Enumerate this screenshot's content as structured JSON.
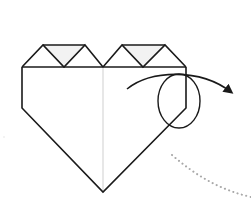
{
  "diagram": {
    "step_instruction": "fold corner behind (mountain fold) at circled area",
    "colors": {
      "stroke": "#1a1a1a",
      "crease": "#cfcfcf",
      "flap_fill": "#f2f2f2",
      "dotted_arc": "#a8a8a8",
      "background": "#ffffff"
    },
    "elements": [
      {
        "name": "heart-outline",
        "type": "polygon"
      },
      {
        "name": "center-crease",
        "type": "line"
      },
      {
        "name": "top-band-line",
        "type": "line"
      },
      {
        "name": "left-triangle-flaps",
        "type": "triangles",
        "count": 3
      },
      {
        "name": "right-triangle-flaps",
        "type": "triangles",
        "count": 3
      },
      {
        "name": "focus-circle",
        "type": "ellipse"
      },
      {
        "name": "fold-arrow",
        "type": "curved-arrow",
        "direction": "right-down"
      },
      {
        "name": "dotted-arc",
        "type": "dotted-curve"
      }
    ]
  }
}
